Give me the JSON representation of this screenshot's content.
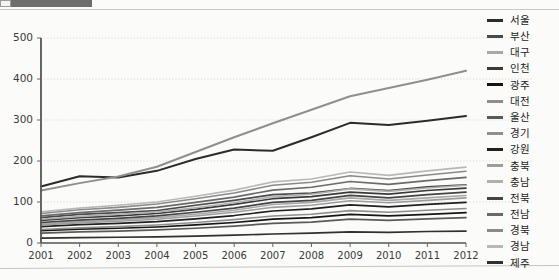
{
  "artifact": {
    "top_bar_present": true,
    "top_rule_present": true,
    "bottom_rule_present": true
  },
  "chart_data": {
    "type": "line",
    "title": "",
    "xlabel": "",
    "ylabel": "",
    "x": [
      2001,
      2002,
      2003,
      2004,
      2005,
      2006,
      2007,
      2008,
      2009,
      2010,
      2011,
      2012
    ],
    "xticklabels": [
      "2001",
      "2002",
      "2003",
      "2004",
      "2005",
      "2006",
      "2007",
      "2008",
      "2009",
      "2010",
      "2011",
      "2012"
    ],
    "yticks": [
      0,
      100,
      200,
      300,
      400,
      500
    ],
    "yticklabels": [
      "0",
      "100",
      "200",
      "300",
      "400",
      "500"
    ],
    "ylim": [
      0,
      500
    ],
    "grid": true,
    "legend_position": "right",
    "series": [
      {
        "name": "서울",
        "color": "#2b2b2b",
        "width": 2.0,
        "values": [
          138,
          163,
          160,
          176,
          205,
          228,
          225,
          258,
          293,
          288,
          298,
          310
        ]
      },
      {
        "name": "부산",
        "color": "#4a4a4a",
        "width": 1.7,
        "values": [
          62,
          70,
          74,
          79,
          92,
          104,
          118,
          122,
          133,
          128,
          137,
          142
        ]
      },
      {
        "name": "대구",
        "color": "#a8a8a8",
        "width": 1.6,
        "values": [
          46,
          52,
          56,
          62,
          70,
          80,
          94,
          99,
          110,
          104,
          110,
          116
        ]
      },
      {
        "name": "인천",
        "color": "#3a3a3a",
        "width": 1.7,
        "values": [
          55,
          62,
          66,
          72,
          82,
          94,
          108,
          113,
          124,
          119,
          128,
          134
        ]
      },
      {
        "name": "광주",
        "color": "#151515",
        "width": 1.7,
        "values": [
          30,
          34,
          36,
          39,
          44,
          50,
          58,
          62,
          70,
          66,
          70,
          74
        ]
      },
      {
        "name": "대전",
        "color": "#8e8e8e",
        "width": 1.6,
        "values": [
          33,
          37,
          40,
          44,
          50,
          57,
          66,
          70,
          79,
          75,
          80,
          84
        ]
      },
      {
        "name": "울산",
        "color": "#5a5a5a",
        "width": 1.7,
        "values": [
          24,
          27,
          29,
          32,
          36,
          41,
          48,
          51,
          58,
          55,
          59,
          62
        ]
      },
      {
        "name": "경기",
        "color": "#8f8f8f",
        "width": 2.0,
        "values": [
          128,
          146,
          162,
          186,
          222,
          258,
          292,
          325,
          358,
          378,
          398,
          420
        ]
      },
      {
        "name": "강원",
        "color": "#1f1f1f",
        "width": 1.7,
        "values": [
          40,
          45,
          48,
          52,
          59,
          67,
          78,
          83,
          93,
          88,
          94,
          99
        ]
      },
      {
        "name": "충북",
        "color": "#9d9d9d",
        "width": 1.6,
        "values": [
          44,
          49,
          53,
          58,
          66,
          75,
          87,
          92,
          103,
          98,
          104,
          110
        ]
      },
      {
        "name": "충남",
        "color": "#b0b0b0",
        "width": 1.6,
        "values": [
          58,
          65,
          70,
          76,
          86,
          98,
          113,
          119,
          132,
          126,
          134,
          141
        ]
      },
      {
        "name": "전북",
        "color": "#444444",
        "width": 1.7,
        "values": [
          50,
          56,
          60,
          66,
          75,
          85,
          99,
          104,
          116,
          110,
          118,
          124
        ]
      },
      {
        "name": "전남",
        "color": "#6a6a6a",
        "width": 1.7,
        "values": [
          66,
          74,
          80,
          87,
          99,
          112,
          129,
          136,
          150,
          143,
          152,
          160
        ]
      },
      {
        "name": "경북",
        "color": "#8a8a8a",
        "width": 1.6,
        "values": [
          72,
          81,
          87,
          95,
          108,
          122,
          141,
          148,
          164,
          156,
          166,
          175
        ]
      },
      {
        "name": "경남",
        "color": "#b8b8b8",
        "width": 1.6,
        "values": [
          76,
          85,
          92,
          100,
          114,
          129,
          149,
          156,
          173,
          165,
          176,
          185
        ]
      },
      {
        "name": "제주",
        "color": "#303030",
        "width": 1.7,
        "values": [
          12,
          13,
          14,
          15,
          17,
          19,
          22,
          24,
          27,
          26,
          28,
          29
        ]
      }
    ]
  }
}
